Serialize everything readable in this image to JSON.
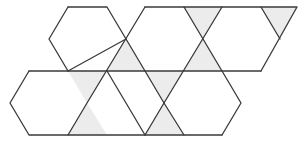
{
  "figure": {
    "colors": {
      "background": "#ffffff",
      "stroke": "#3a3a3a",
      "shade": "#ececec"
    },
    "shaded_triangles": [
      [
        [
          126,
          39
        ],
        [
          107,
          71
        ],
        [
          145,
          71
        ]
      ],
      [
        [
          184,
          7
        ],
        [
          222,
          7
        ],
        [
          203,
          39
        ]
      ],
      [
        [
          203,
          39
        ],
        [
          184,
          71
        ],
        [
          222,
          71
        ]
      ],
      [
        [
          261,
          7
        ],
        [
          297,
          7
        ],
        [
          280,
          39
        ]
      ],
      [
        [
          68,
          71
        ],
        [
          107,
          71
        ],
        [
          87,
          103
        ]
      ],
      [
        [
          87,
          103
        ],
        [
          68,
          135
        ],
        [
          107,
          135
        ]
      ],
      [
        [
          145,
          71
        ],
        [
          184,
          71
        ],
        [
          164,
          103
        ]
      ],
      [
        [
          164,
          103
        ],
        [
          145,
          135
        ],
        [
          184,
          135
        ]
      ]
    ],
    "polylines": [
      [
        [
          68,
          7
        ],
        [
          107,
          7
        ],
        [
          164,
          103
        ],
        [
          184,
          135
        ]
      ],
      [
        [
          68,
          7
        ],
        [
          49,
          39
        ],
        [
          68,
          71
        ]
      ],
      [
        [
          145,
          7
        ],
        [
          87,
          103
        ],
        [
          68,
          135
        ]
      ],
      [
        [
          145,
          7
        ],
        [
          297,
          7
        ],
        [
          261,
          71
        ]
      ],
      [
        [
          184,
          7
        ],
        [
          241,
          103
        ],
        [
          222,
          135
        ]
      ],
      [
        [
          222,
          7
        ],
        [
          164,
          103
        ],
        [
          145,
          135
        ]
      ],
      [
        [
          261,
          7
        ],
        [
          280,
          39
        ]
      ],
      [
        [
          29,
          71
        ],
        [
          261,
          71
        ]
      ],
      [
        [
          29,
          71
        ],
        [
          10,
          103
        ],
        [
          29,
          135
        ],
        [
          222,
          135
        ]
      ],
      [
        [
          107,
          71
        ],
        [
          145,
          135
        ]
      ],
      [
        [
          68,
          71
        ],
        [
          126,
          39
        ]
      ]
    ]
  }
}
